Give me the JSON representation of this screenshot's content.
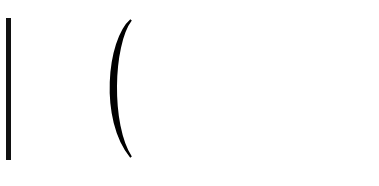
{
  "diagram": {
    "type": "guitar-chord-fretboard",
    "strings": 6,
    "string_y": [
      19,
      46,
      74,
      101,
      130,
      158
    ],
    "fret_x": [
      60,
      115,
      168,
      222,
      276,
      330
    ],
    "nut_x": 8,
    "right_edge_x": 379,
    "colors": {
      "string": "#8a8a8a",
      "fret": "#7a7a7a",
      "nut": "#111111",
      "dot": "#000000",
      "open_dot_fill": "#ffffff",
      "barre": "#000000"
    },
    "dots": [
      {
        "x": 141,
        "y": 17,
        "filled": true
      },
      {
        "x": 141,
        "y": 44,
        "filled": true
      },
      {
        "x": 195,
        "y": 73,
        "filled": true
      },
      {
        "x": 141,
        "y": 101,
        "filled": true
      },
      {
        "x": 251,
        "y": 130,
        "filled": true
      },
      {
        "x": 141,
        "y": 158,
        "filled": false
      }
    ],
    "barre": {
      "from_string": 1,
      "to_string": 6,
      "fret": 3
    },
    "fret_labels": [
      {
        "text": "3",
        "x": 142
      },
      {
        "text": "5",
        "x": 250
      },
      {
        "text": "7",
        "x": 357
      }
    ]
  }
}
